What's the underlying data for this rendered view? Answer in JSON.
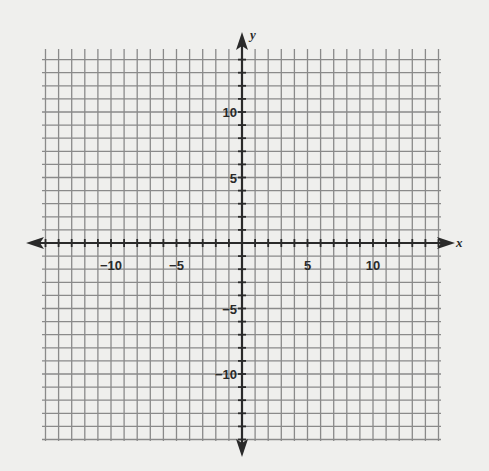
{
  "chart_data": {
    "type": "coordinate-grid",
    "title": "",
    "xlabel": "x",
    "ylabel": "y",
    "xlim": [
      -15,
      15
    ],
    "ylim": [
      -15,
      15
    ],
    "grid": true,
    "grid_step": 1,
    "x_tick_labels": [
      {
        "value": -10,
        "label": "−10"
      },
      {
        "value": -5,
        "label": "−5"
      },
      {
        "value": 5,
        "label": "5"
      },
      {
        "value": 10,
        "label": "10"
      }
    ],
    "y_tick_labels": [
      {
        "value": 10,
        "label": "10"
      },
      {
        "value": 5,
        "label": "5"
      },
      {
        "value": -5,
        "label": "−5"
      },
      {
        "value": -10,
        "label": "−10"
      }
    ],
    "series": [],
    "colors": {
      "background": "#efefed",
      "grid": "#8a8a8a",
      "axis": "#2a2a2a"
    }
  },
  "axes": {
    "x_label": "x",
    "y_label": "y"
  }
}
